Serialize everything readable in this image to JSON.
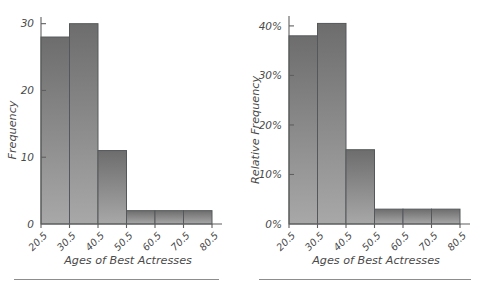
{
  "figure": {
    "background": "#ffffff",
    "bar_fill_top": "#6d6d6d",
    "bar_fill_bottom": "#a6a6a6",
    "bar_stroke": "#55585a",
    "axis_color": "#5f5f5f",
    "text_color": "#4a4a4a"
  },
  "chart_data": [
    {
      "type": "bar",
      "id": "frequency-histogram",
      "title": "",
      "xlabel": "Ages of Best Actresses",
      "ylabel": "Frequency",
      "categories": [
        "20.5",
        "30.5",
        "40.5",
        "50.5",
        "60.5",
        "70.5",
        "80.5"
      ],
      "bin_edges": [
        20.5,
        30.5,
        40.5,
        50.5,
        60.5,
        70.5,
        80.5
      ],
      "values": [
        28,
        30,
        11,
        2,
        2,
        2
      ],
      "ylim": [
        0,
        31
      ],
      "yticks": [
        0,
        10,
        20,
        30
      ],
      "ytick_labels": [
        "0",
        "10",
        "20",
        "30"
      ],
      "xtick_labels": [
        "20.5",
        "30.5",
        "40.5",
        "50.5",
        "60.5",
        "70.5",
        "80.5"
      ],
      "grid": false,
      "legend": "none",
      "xtick_rotation": 45
    },
    {
      "type": "bar",
      "id": "relative-frequency-histogram",
      "title": "",
      "xlabel": "Ages of Best Actresses",
      "ylabel": "Relative Frequency",
      "categories": [
        "20.5",
        "30.5",
        "40.5",
        "50.5",
        "60.5",
        "70.5",
        "80.5"
      ],
      "bin_edges": [
        20.5,
        30.5,
        40.5,
        50.5,
        60.5,
        70.5,
        80.5
      ],
      "values": [
        38,
        40.5,
        15,
        3,
        3,
        3
      ],
      "ylim": [
        0,
        42
      ],
      "yticks": [
        0,
        10,
        20,
        30,
        40
      ],
      "ytick_labels": [
        "0%",
        "10%",
        "20%",
        "30%",
        "40%"
      ],
      "xtick_labels": [
        "20.5",
        "30.5",
        "40.5",
        "50.5",
        "60.5",
        "70.5",
        "80.5"
      ],
      "grid": false,
      "legend": "none",
      "xtick_rotation": 45
    }
  ]
}
